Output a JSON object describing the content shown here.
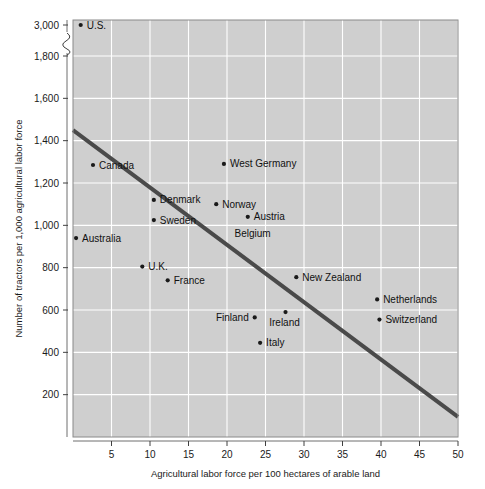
{
  "chart_data": {
    "type": "scatter",
    "title": "",
    "xlabel": "Agricultural labor force per 100 hectares of arable land",
    "ylabel": "Number of tractors per 1,000 agricultural labor force",
    "xlim": [
      0,
      50
    ],
    "ylim": [
      0,
      1800
    ],
    "y_axis_break": true,
    "y_break_between": [
      1800,
      3000
    ],
    "xticks": [
      5,
      10,
      15,
      20,
      25,
      30,
      35,
      40,
      45,
      50
    ],
    "xtick_labels": [
      "5",
      "10",
      "15",
      "20",
      "25",
      "30",
      "35",
      "40",
      "45",
      "50"
    ],
    "yticks": [
      200,
      400,
      600,
      800,
      1000,
      1200,
      1400,
      1600,
      1800,
      3000
    ],
    "ytick_labels": [
      "200",
      "400",
      "600",
      "800",
      "1,000",
      "1,200",
      "1,400",
      "1,600",
      "1,800",
      "3,000"
    ],
    "grid": true,
    "legend": "none",
    "points": [
      {
        "label": "U.S.",
        "x": 1.0,
        "y": 2950,
        "label_pos": "right"
      },
      {
        "label": "Canada",
        "x": 2.6,
        "y": 1285,
        "label_pos": "right"
      },
      {
        "label": "Australia",
        "x": 0.4,
        "y": 940,
        "label_pos": "right"
      },
      {
        "label": "Denmark",
        "x": 10.5,
        "y": 1120,
        "label_pos": "right"
      },
      {
        "label": "Sweden",
        "x": 10.5,
        "y": 1025,
        "label_pos": "right"
      },
      {
        "label": "U.K.",
        "x": 9.0,
        "y": 805,
        "label_pos": "right"
      },
      {
        "label": "France",
        "x": 12.3,
        "y": 740,
        "label_pos": "right"
      },
      {
        "label": "West Germany",
        "x": 19.6,
        "y": 1290,
        "label_pos": "right"
      },
      {
        "label": "Norway",
        "x": 18.6,
        "y": 1100,
        "label_pos": "right"
      },
      {
        "label": "Austria",
        "x": 22.7,
        "y": 1040,
        "label_pos": "right"
      },
      {
        "label": "Belgium",
        "x": 21.5,
        "y": 960,
        "label_pos": "right-nomarker"
      },
      {
        "label": "Finland",
        "x": 23.6,
        "y": 565,
        "label_pos": "left"
      },
      {
        "label": "Italy",
        "x": 24.3,
        "y": 445,
        "label_pos": "right"
      },
      {
        "label": "Ireland",
        "x": 27.6,
        "y": 590,
        "label_pos": "below"
      },
      {
        "label": "New Zealand",
        "x": 29.0,
        "y": 755,
        "label_pos": "right"
      },
      {
        "label": "Netherlands",
        "x": 39.5,
        "y": 650,
        "label_pos": "right"
      },
      {
        "label": "Switzerland",
        "x": 39.8,
        "y": 555,
        "label_pos": "right"
      }
    ],
    "trendline": {
      "type": "linear",
      "x_start": 0,
      "y_start": 1450,
      "x_end": 50,
      "y_end": 95
    }
  }
}
